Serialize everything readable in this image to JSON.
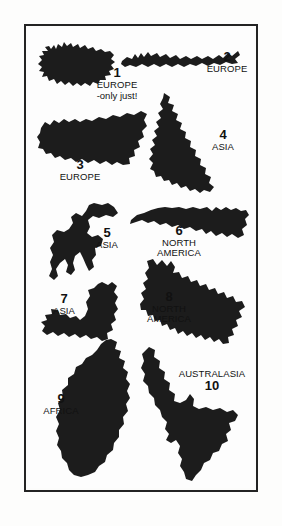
{
  "page": {
    "background_color": "#fdfdfc",
    "plate_background": "#fdfdfd",
    "border_color": "#232323",
    "silhouette_color": "#1c1c1c",
    "text_color": "#111111"
  },
  "islands": [
    {
      "number": "1",
      "continent": "EUROPE",
      "note": "-only just!",
      "icon_name": "iceland-silhouette"
    },
    {
      "number": "2",
      "continent": "EUROPE",
      "note": "",
      "icon_name": "crete-silhouette"
    },
    {
      "number": "3",
      "continent": "EUROPE",
      "note": "",
      "icon_name": "sicily-silhouette"
    },
    {
      "number": "4",
      "continent": "ASIA",
      "note": "",
      "icon_name": "sumatra-silhouette"
    },
    {
      "number": "5",
      "continent": "ASIA",
      "note": "",
      "icon_name": "sulawesi-silhouette"
    },
    {
      "number": "6",
      "continent_line_1": "NORTH",
      "continent_line_2": "AMERICA",
      "note": "",
      "icon_name": "cuba-silhouette"
    },
    {
      "number": "7",
      "continent": "ASIA",
      "note": "",
      "icon_name": "honshu-silhouette"
    },
    {
      "number": "8",
      "continent_line_1": "NORTH",
      "continent_line_2": "AMERICA",
      "note": "",
      "icon_name": "newfoundland-silhouette"
    },
    {
      "number": "9",
      "continent": "AFRICA",
      "note": "",
      "icon_name": "madagascar-silhouette"
    },
    {
      "number": "10",
      "continent": "AUSTRALASIA",
      "note": "",
      "icon_name": "new-zealand-north-island-silhouette"
    }
  ]
}
